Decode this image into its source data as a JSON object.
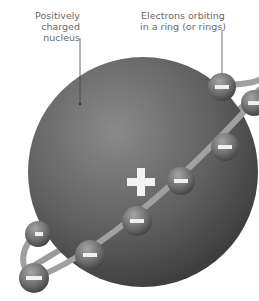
{
  "diagram": {
    "labels": {
      "nucleus": "Positively\ncharged\nnucleus",
      "electrons": "Electrons orbiting\nin a ring (or rings)"
    },
    "nucleus": {
      "charge_symbol": "+",
      "color": "#5a5a5a"
    },
    "electrons": {
      "charge_symbol": "−",
      "count": 8,
      "color": "#6e6e6e"
    },
    "ring_color": "#9a9a9a",
    "leader_line_color": "#444444"
  }
}
